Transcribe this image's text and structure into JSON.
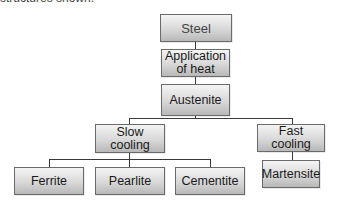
{
  "caption": "structures shown.",
  "diagram": {
    "nodes": {
      "steel": "Steel",
      "heat": "Application of heat",
      "heat_line1": "Application",
      "heat_line2": "of heat",
      "austenite": "Austenite",
      "slow_cooling": "Slow cooling",
      "fast_cooling": "Fast cooling",
      "ferrite": "Ferrite",
      "pearlite": "Pearlite",
      "cementite": "Cementite",
      "martensite": "Martensite"
    },
    "edges": [
      [
        "Steel",
        "Application of heat"
      ],
      [
        "Application of heat",
        "Austenite"
      ],
      [
        "Austenite",
        "Slow cooling"
      ],
      [
        "Austenite",
        "Fast cooling"
      ],
      [
        "Slow cooling",
        "Ferrite"
      ],
      [
        "Slow cooling",
        "Pearlite"
      ],
      [
        "Slow cooling",
        "Cementite"
      ],
      [
        "Fast cooling",
        "Martensite"
      ]
    ]
  }
}
